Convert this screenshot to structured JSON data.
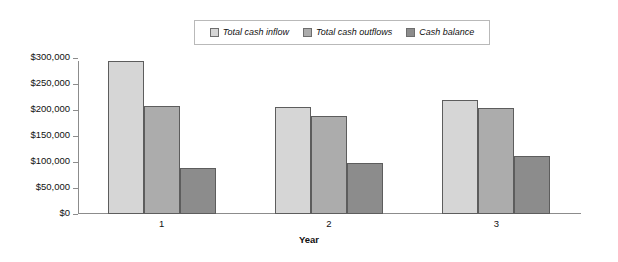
{
  "chart_data": {
    "type": "bar",
    "title": "",
    "subtitle": "",
    "xlabel": "Year",
    "ylabel": "",
    "categories": [
      "1",
      "2",
      "3"
    ],
    "series": [
      {
        "name": "Total cash inflow",
        "values": [
          295000,
          205000,
          219000
        ],
        "color": "#d6d6d6"
      },
      {
        "name": "Total cash outflows",
        "values": [
          207000,
          188000,
          203000
        ],
        "color": "#acacac"
      },
      {
        "name": "Cash balance",
        "values": [
          88000,
          98000,
          112000
        ],
        "color": "#8c8c8c"
      }
    ],
    "ylim": [
      0,
      300000
    ],
    "ytick_values": [
      0,
      50000,
      100000,
      150000,
      200000,
      250000,
      300000
    ],
    "ytick_labels": [
      "$0",
      "$50,000",
      "$100,000",
      "$150,000",
      "$200,000",
      "$250,000",
      "$300,000"
    ],
    "grid": false,
    "legend_position": "top-center",
    "legend_entries": [
      "Total cash inflow",
      "Total cash outflows",
      "Cash balance"
    ]
  }
}
